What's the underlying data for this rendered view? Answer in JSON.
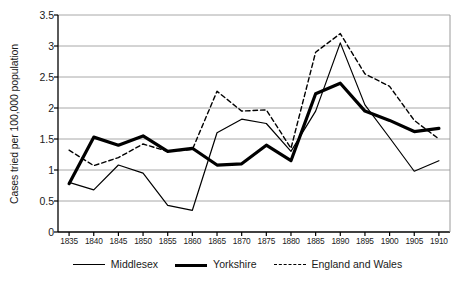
{
  "chart_data": {
    "type": "line",
    "title": "",
    "xlabel": "",
    "ylabel": "Cases tried per 100,000 population",
    "ylim": [
      0,
      3.5
    ],
    "yticks": [
      "0",
      "0.5",
      "1",
      "1.5",
      "2",
      "2.5",
      "3",
      "3.5"
    ],
    "grid": true,
    "legend_position": "bottom",
    "categories": [
      "1835",
      "1840",
      "1845",
      "1850",
      "1855",
      "1860",
      "1865",
      "1870",
      "1875",
      "1880",
      "1885",
      "1890",
      "1895",
      "1900",
      "1905",
      "1910"
    ],
    "series": [
      {
        "name": "Middlesex",
        "style": "thin-solid",
        "color": "#000000",
        "values": [
          0.8,
          0.68,
          1.08,
          0.95,
          0.43,
          0.35,
          1.6,
          1.82,
          1.75,
          1.3,
          1.95,
          3.05,
          2.05,
          1.52,
          0.98,
          1.15
        ]
      },
      {
        "name": "Yorkshire",
        "style": "thick-solid",
        "color": "#000000",
        "values": [
          0.78,
          1.53,
          1.4,
          1.55,
          1.3,
          1.35,
          1.08,
          1.1,
          1.4,
          1.15,
          2.23,
          2.4,
          1.95,
          1.8,
          1.62,
          1.67
        ]
      },
      {
        "name": "England and Wales",
        "style": "dashed",
        "color": "#000000",
        "values": [
          1.32,
          1.07,
          1.2,
          1.42,
          1.3,
          1.33,
          2.27,
          1.95,
          1.97,
          1.35,
          2.9,
          3.2,
          2.55,
          2.35,
          1.8,
          1.5
        ]
      }
    ]
  },
  "legend": {
    "items": [
      {
        "label": "Middlesex",
        "swatch": "thin-solid-line-icon"
      },
      {
        "label": "Yorkshire",
        "swatch": "thick-solid-line-icon"
      },
      {
        "label": "England and Wales",
        "swatch": "dashed-line-icon"
      }
    ]
  }
}
